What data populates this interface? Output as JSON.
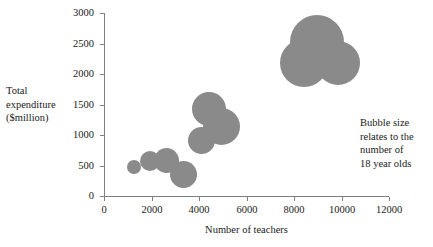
{
  "chart_data": {
    "type": "scatter",
    "title": "",
    "xlabel": "Number of teachers",
    "ylabel": "Total expenditure\n($million)",
    "ylabel_lines": [
      "Total",
      "expenditure",
      "($million)"
    ],
    "xlim": [
      0,
      12000
    ],
    "ylim": [
      0,
      3000
    ],
    "xticks": [
      0,
      2000,
      4000,
      6000,
      8000,
      10000,
      12000
    ],
    "yticks": [
      0,
      500,
      1000,
      1500,
      2000,
      2500,
      3000
    ],
    "xtick_labels": [
      "0",
      "2000",
      "4000",
      "6000",
      "8000",
      "10000",
      "12000"
    ],
    "ytick_labels": [
      "0",
      "500",
      "1000",
      "1500",
      "2000",
      "2500",
      "3000"
    ],
    "grid": false,
    "legend": null,
    "annotation": "Bubble size\nrelates to the\nnumber of\n18 year olds",
    "annotation_lines": [
      "Bubble size",
      "relates to the",
      "number of",
      "18 year olds"
    ],
    "bubble_color": "#8a8a8a",
    "axis_color": "#808080",
    "size_meaning": "number of 18 year olds",
    "points": [
      {
        "x": 1250,
        "y": 480,
        "r": 7
      },
      {
        "x": 1950,
        "y": 575,
        "r": 10
      },
      {
        "x": 2650,
        "y": 590,
        "r": 12.5
      },
      {
        "x": 3350,
        "y": 350,
        "r": 13.5
      },
      {
        "x": 4100,
        "y": 905,
        "r": 13.5
      },
      {
        "x": 4400,
        "y": 1430,
        "r": 17
      },
      {
        "x": 4950,
        "y": 1140,
        "r": 18.5
      },
      {
        "x": 8400,
        "y": 2180,
        "r": 24
      },
      {
        "x": 8950,
        "y": 2530,
        "r": 27
      },
      {
        "x": 9850,
        "y": 2180,
        "r": 22
      }
    ]
  }
}
